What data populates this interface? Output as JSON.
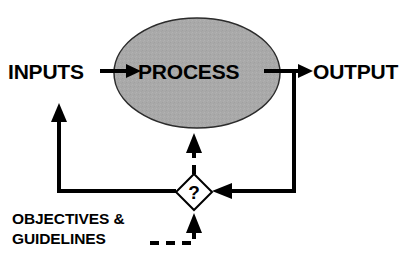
{
  "diagram": {
    "background_color": "#ffffff",
    "line_color": "#000000",
    "text_color": "#000000",
    "nodes": {
      "inputs": {
        "label": "INPUTS",
        "shape": "text",
        "x": 8,
        "y": 78
      },
      "process": {
        "label": "PROCESS",
        "shape": "ellipse",
        "fill_color": "#a9a9a9",
        "border_color": "#2b2b2b",
        "cx": 197,
        "cy": 73,
        "rx": 83,
        "ry": 55
      },
      "output": {
        "label": "OUTPUT",
        "shape": "text",
        "x": 313,
        "y": 78
      },
      "decision": {
        "label": "?",
        "shape": "diamond",
        "fill_color": "#ffffff",
        "border_color": "#000000",
        "cx": 194,
        "cy": 192,
        "half_size": 18
      },
      "objectives": {
        "line1": "OBJECTIVES &",
        "line2": "GUIDELINES",
        "shape": "text",
        "x": 12,
        "y1": 224,
        "y2": 244
      }
    },
    "connectors": [
      {
        "name": "inputs-to-process",
        "style": "solid",
        "from": "inputs",
        "to": "process",
        "arrow": true
      },
      {
        "name": "process-to-output",
        "style": "solid",
        "from": "process",
        "to": "output",
        "arrow": true
      },
      {
        "name": "output-to-decision",
        "style": "solid",
        "from": "output",
        "to": "decision",
        "arrow": true
      },
      {
        "name": "decision-to-inputs",
        "style": "solid",
        "from": "decision",
        "to": "inputs",
        "arrow": true
      },
      {
        "name": "decision-to-process",
        "style": "dashed",
        "from": "decision",
        "to": "process",
        "arrow": true
      },
      {
        "name": "objectives-to-decision",
        "style": "dashed",
        "from": "objectives",
        "to": "decision",
        "arrow": true
      }
    ]
  }
}
